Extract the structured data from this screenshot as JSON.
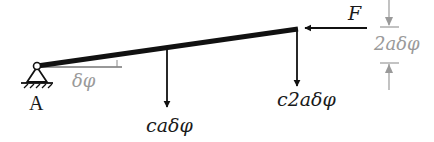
{
  "diagram": {
    "type": "mechanics-virtual-displacement",
    "support": {
      "label": "A",
      "kind": "pin-support"
    },
    "rotation_angle": {
      "label": "δφ"
    },
    "forces": [
      {
        "label": "caδφ",
        "direction": "down"
      },
      {
        "label": "c2aδφ",
        "direction": "down"
      },
      {
        "label": "F",
        "direction": "left"
      }
    ],
    "dimension": {
      "label": "2aδφ"
    },
    "colors": {
      "beam": "#111111",
      "annotation": "#9a9a9a"
    }
  }
}
